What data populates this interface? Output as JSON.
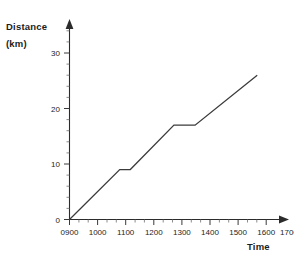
{
  "chart_data": {
    "type": "line",
    "title": "",
    "subtitle": "",
    "xlabel": "Time",
    "ylabel_line1": "Distance",
    "ylabel_line2": "(km)",
    "x_tick_labels": [
      "0900",
      "1000",
      "1100",
      "1200",
      "1300",
      "1400",
      "1500",
      "1600",
      "1700"
    ],
    "x_tick_values": [
      900,
      1000,
      1100,
      1200,
      1300,
      1400,
      1500,
      1600,
      1700
    ],
    "y_tick_labels": [
      "0",
      "10",
      "20",
      "30"
    ],
    "y_tick_values": [
      0,
      10,
      20,
      30
    ],
    "xlim": [
      900,
      1700
    ],
    "ylim": [
      0,
      30
    ],
    "grid": false,
    "legend": false,
    "x_minor_ticks_per_interval": 2,
    "y_minor_ticks_per_interval": 5,
    "series": [
      {
        "name": "Journey",
        "x": [
          900,
          1090,
          1130,
          1295,
          1375,
          1610
        ],
        "y": [
          0,
          9,
          9,
          17,
          17,
          26
        ]
      }
    ],
    "annotations": []
  },
  "axis_titles": {
    "y_line1": "Distance",
    "y_line2": "(km)",
    "x": "Time"
  },
  "colors": {
    "background": "#ffffff",
    "axis": "#2b2b2b",
    "line": "#3b3b3b",
    "text": "#1c1c1c"
  }
}
